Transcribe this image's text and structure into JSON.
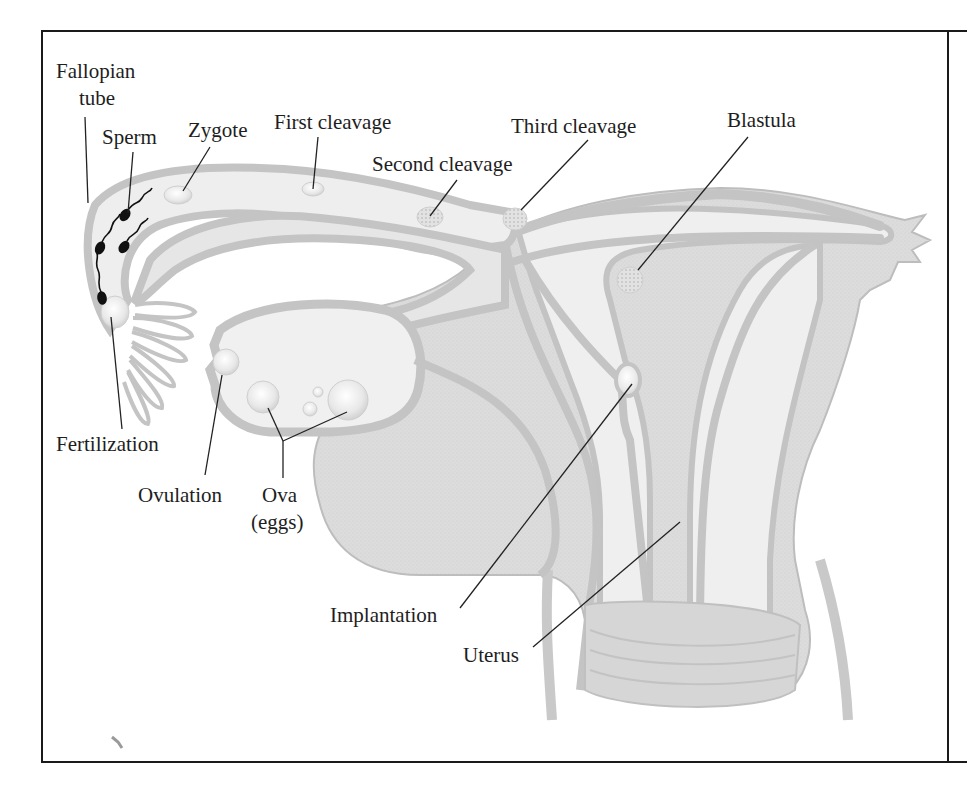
{
  "figure": {
    "colors": {
      "frame": "#1a1a1a",
      "tissue_wall": "#c8c8c8",
      "tissue_fill": "#dedede",
      "lumen": "#efefef",
      "cell": "#e4e4e4",
      "sperm": "#111111",
      "leader_line": "#222222",
      "text": "#1e1e1e"
    }
  },
  "labels": {
    "fallopian_tube_line1": "Fallopian",
    "fallopian_tube_line2": "tube",
    "sperm": "Sperm",
    "zygote": "Zygote",
    "first_cleavage": "First cleavage",
    "second_cleavage": "Second cleavage",
    "third_cleavage": "Third cleavage",
    "blastula": "Blastula",
    "fertilization": "Fertilization",
    "ovulation": "Ovulation",
    "ova_line1": "Ova",
    "ova_line2": "(eggs)",
    "implantation": "Implantation",
    "uterus": "Uterus"
  }
}
